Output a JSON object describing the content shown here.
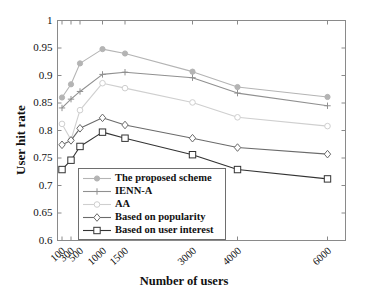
{
  "chart_data": {
    "type": "line",
    "title": "",
    "xlabel": "Number of users",
    "ylabel": "User hit rate",
    "x": [
      100,
      300,
      500,
      1000,
      1500,
      3000,
      4000,
      6000
    ],
    "xtick_labels": [
      "100",
      "300",
      "500",
      "1000",
      "1500",
      "3000",
      "4000",
      "6000"
    ],
    "xlim": [
      0,
      6400
    ],
    "ylim": [
      0.6,
      1.0
    ],
    "ytick_labels": [
      "0.6",
      "0.65",
      "0.7",
      "0.75",
      "0.8",
      "0.85",
      "0.9",
      "0.95",
      "1"
    ],
    "yticks": [
      0.6,
      0.65,
      0.7,
      0.75,
      0.8,
      0.85,
      0.9,
      0.95,
      1.0
    ],
    "grid": false,
    "legend_position": "lower-left-inside",
    "series": [
      {
        "name": "The proposed scheme",
        "marker": "filled-circle",
        "color": "#b4b4b4",
        "values": [
          0.86,
          0.884,
          0.922,
          0.948,
          0.94,
          0.907,
          0.879,
          0.861
        ]
      },
      {
        "name": "IENN-A",
        "marker": "plus",
        "color": "#909090",
        "values": [
          0.841,
          0.857,
          0.871,
          0.902,
          0.906,
          0.896,
          0.868,
          0.845
        ]
      },
      {
        "name": "AA",
        "marker": "open-circle",
        "color": "#cfcfcf",
        "values": [
          0.812,
          0.783,
          0.837,
          0.886,
          0.877,
          0.851,
          0.824,
          0.808
        ]
      },
      {
        "name": "Based on popularity",
        "marker": "diamond",
        "color": "#6b6b6b",
        "values": [
          0.774,
          0.782,
          0.804,
          0.823,
          0.81,
          0.786,
          0.769,
          0.757
        ]
      },
      {
        "name": "Based on user interest",
        "marker": "square",
        "color": "#333333",
        "values": [
          0.729,
          0.746,
          0.771,
          0.797,
          0.786,
          0.756,
          0.729,
          0.712
        ]
      }
    ]
  },
  "axes": {
    "y_axis_title": "User hit rate",
    "x_axis_title": "Number of users"
  },
  "legend": {
    "items": [
      {
        "label": "The proposed scheme"
      },
      {
        "label": "IENN-A"
      },
      {
        "label": "AA"
      },
      {
        "label": "Based on popularity"
      },
      {
        "label": "Based on user interest"
      }
    ]
  }
}
